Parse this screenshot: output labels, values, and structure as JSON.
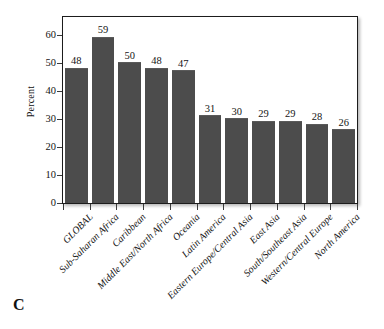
{
  "panel": {
    "letter": "C"
  },
  "chart_data": {
    "type": "bar",
    "title": "",
    "subtitle": "",
    "xlabel": "",
    "ylabel": "Percent",
    "ylim": [
      0,
      65
    ],
    "yticks": [
      0,
      10,
      20,
      30,
      40,
      50,
      60
    ],
    "ytick_labels": [
      "0",
      "10",
      "20",
      "30",
      "40",
      "50",
      "60"
    ],
    "grid": false,
    "legend": null,
    "bar_color": "#4c4c4c",
    "frame_color": "#1c1c1c",
    "categories": [
      "GLOBAL",
      "Sub-Saharan Africa",
      "Caribbean",
      "Middle East/North Africa",
      "Oceania",
      "Latin America",
      "Eastern Europe/Central Asia",
      "East Asia",
      "South/Southeast Asia",
      "Western/Central Europe",
      "North America"
    ],
    "values": [
      48,
      59,
      50,
      48,
      47,
      31,
      30,
      29,
      29,
      28,
      26
    ],
    "value_labels": [
      "48",
      "59",
      "50",
      "48",
      "47",
      "31",
      "30",
      "29",
      "29",
      "28",
      "26"
    ]
  }
}
